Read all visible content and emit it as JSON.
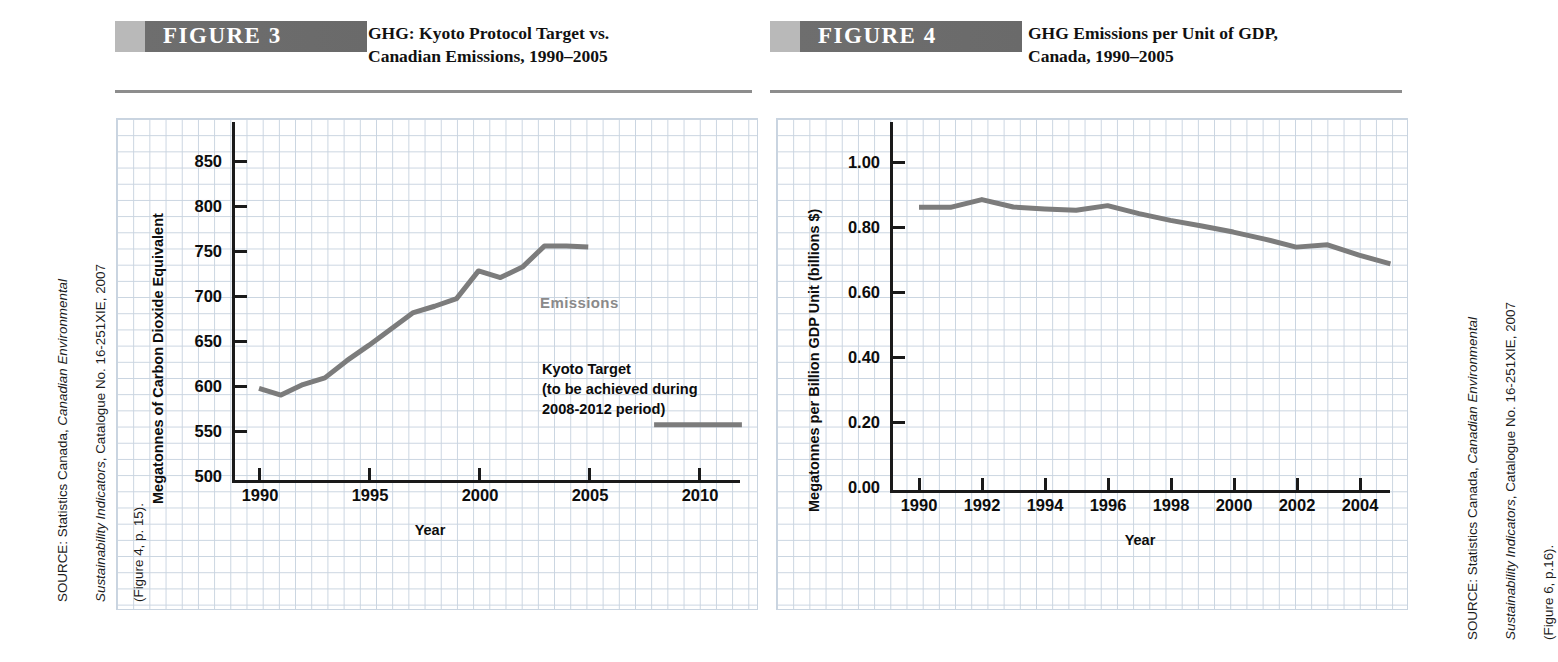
{
  "figures": [
    {
      "badge": "FIGURE 3",
      "title": "GHG: Kyoto Protocol Target vs.\nCanadian Emissions, 1990–2005",
      "source_line1_plain": "SOURCE: Statistics Canada, ",
      "source_line1_italic": "Canadian Environmental",
      "source_line2_italic": "Sustainability Indicators",
      "source_line2_plain": ", Catalogue No. 16-251XIE, 2007",
      "source_line3": "(Figure 4, p. 15).",
      "annotations": {
        "emissions": "Emissions",
        "kyoto": "Kyoto Target\n(to be achieved during\n2008-2012 period)"
      }
    },
    {
      "badge": "FIGURE 4",
      "title": "GHG Emissions per Unit of GDP,\nCanada, 1990–2005",
      "source_line1_plain": "SOURCE: Statistics Canada, ",
      "source_line1_italic": "Canadian Environmental",
      "source_line2_italic": "Sustainability Indicators",
      "source_line2_plain": ", Catalogue No. 16-251XIE, 2007",
      "source_line3": "(Figure 6, p.16)."
    }
  ],
  "chart_data": [
    {
      "type": "line",
      "title": "GHG: Kyoto Protocol Target vs. Canadian Emissions, 1990–2005",
      "xlabel": "Year",
      "ylabel": "Megatonnes of Carbon Dioxide Equivalent",
      "xlim": [
        1990,
        2012
      ],
      "ylim": [
        500,
        875
      ],
      "yticks": [
        500,
        550,
        600,
        650,
        700,
        750,
        800,
        850
      ],
      "ytick_labels": [
        "500",
        "550",
        "600",
        "650",
        "700",
        "750",
        "800",
        "850"
      ],
      "xticks": [
        1990,
        1995,
        2000,
        2005,
        2010
      ],
      "xtick_labels": [
        "1990",
        "1995",
        "2000",
        "2005",
        "2010"
      ],
      "grid": true,
      "legend": "inline-annotation",
      "line_color": "#7c7c7c",
      "series": [
        {
          "name": "Emissions",
          "x": [
            1990,
            1991,
            1992,
            1993,
            1994,
            1995,
            1996,
            1997,
            1998,
            1999,
            2000,
            2001,
            2002,
            2003,
            2004,
            2005
          ],
          "values": [
            596,
            589,
            600,
            607,
            625,
            641,
            658,
            675,
            682,
            690,
            719,
            712,
            723,
            745,
            745,
            744
          ]
        },
        {
          "name": "Kyoto Target (to be achieved during 2008-2012 period)",
          "x": [
            2008,
            2012
          ],
          "values": [
            558,
            558
          ]
        }
      ]
    },
    {
      "type": "line",
      "title": "GHG Emissions per Unit of GDP, Canada, 1990–2005",
      "xlabel": "Year",
      "ylabel": "Megatonnes per Billion GDP Unit (billions $)",
      "xlim": [
        1990,
        2005
      ],
      "ylim": [
        0.0,
        1.1
      ],
      "yticks": [
        0.0,
        0.2,
        0.4,
        0.6,
        0.8,
        1.0
      ],
      "ytick_labels": [
        "0.00",
        "0.20",
        "0.40",
        "0.60",
        "0.80",
        "1.00"
      ],
      "xticks": [
        1990,
        1992,
        1994,
        1996,
        1998,
        2000,
        2002,
        2004
      ],
      "xtick_labels": [
        "1990",
        "1992",
        "1994",
        "1996",
        "1998",
        "2000",
        "2002",
        "2004"
      ],
      "grid": true,
      "line_color": "#7c7c7c",
      "series": [
        {
          "name": "GHG per GDP",
          "x": [
            1990,
            1991,
            1992,
            1993,
            1994,
            1995,
            1996,
            1997,
            1998,
            1999,
            2000,
            2001,
            2002,
            2003,
            2004,
            2005
          ],
          "values": [
            0.845,
            0.845,
            0.868,
            0.846,
            0.84,
            0.836,
            0.85,
            0.826,
            0.806,
            0.789,
            0.771,
            0.75,
            0.726,
            0.733,
            0.702,
            0.676
          ]
        }
      ]
    }
  ]
}
